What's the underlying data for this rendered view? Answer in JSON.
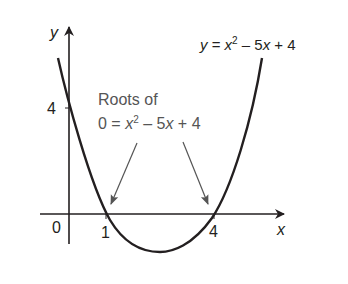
{
  "diagram": {
    "title_equation": {
      "prefix": "y",
      "eq": " = ",
      "x": "x",
      "exp": "2",
      "rest": " – 5",
      "x2": "x",
      "tail": " + 4"
    },
    "annotation": {
      "line1": "Roots of",
      "line2_prefix": "0 = ",
      "x": "x",
      "exp": "2",
      "rest": " – 5",
      "x2": "x",
      "tail": " + 4"
    },
    "axes": {
      "x_label": "x",
      "y_label": "y"
    },
    "ticks": {
      "origin": "0",
      "y_intercept": "4",
      "root1": "1",
      "root2": "4"
    },
    "colors": {
      "curve": "#231f20",
      "axis": "#231f20",
      "arrow": "#555555",
      "label": "#555555"
    }
  }
}
